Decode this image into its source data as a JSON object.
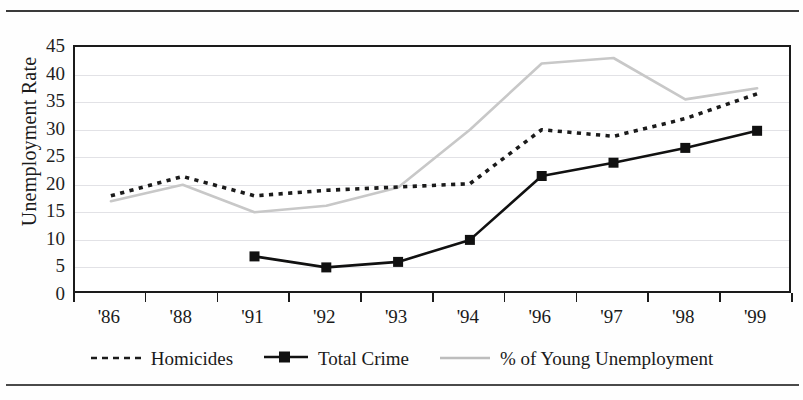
{
  "chart_data": {
    "type": "line",
    "title": "",
    "subtitle": "",
    "xlabel": "",
    "ylabel": "Unemployment Rate",
    "categories": [
      "'86",
      "'88",
      "'91",
      "'92",
      "'93",
      "'94",
      "'96",
      "'97",
      "'98",
      "'99"
    ],
    "ylim": [
      0,
      45
    ],
    "yticks": [
      0,
      5,
      10,
      15,
      20,
      25,
      30,
      35,
      40,
      45
    ],
    "grid": true,
    "legend_position": "bottom",
    "series": [
      {
        "name": "Homicides",
        "style": "dashed",
        "color": "#1b1b1b",
        "marker": "none",
        "values": [
          18.0,
          21.5,
          18.0,
          19.0,
          19.6,
          20.2,
          30.0,
          28.8,
          32.0,
          36.5
        ]
      },
      {
        "name": "Total Crime",
        "style": "solid",
        "color": "#111111",
        "marker": "square",
        "values": [
          null,
          null,
          7.0,
          5.0,
          6.0,
          10.0,
          21.6,
          24.0,
          26.7,
          29.8
        ]
      },
      {
        "name": "% of Young Unemployment",
        "style": "solid",
        "color": "#c8c8c8",
        "marker": "none",
        "values": [
          17.0,
          20.0,
          15.0,
          16.2,
          19.5,
          30.0,
          42.0,
          43.0,
          35.5,
          37.5
        ]
      }
    ]
  },
  "axis": {
    "y_label": "Unemployment Rate",
    "y_tick_labels": [
      "45",
      "40",
      "35",
      "30",
      "25",
      "20",
      "15",
      "10",
      "5",
      "0"
    ],
    "x_tick_labels": [
      "'86",
      "'88",
      "'91",
      "'92",
      "'93",
      "'94",
      "'96",
      "'97",
      "'98",
      "'99"
    ]
  },
  "legend": {
    "items": [
      {
        "label": "Homicides",
        "swatch": "dashed-line-swatch",
        "color": "#1b1b1b"
      },
      {
        "label": "Total Crime",
        "swatch": "solid-line-square-marker-swatch",
        "color": "#111111"
      },
      {
        "label": "% of Young Unemployment",
        "swatch": "solid-gray-line-swatch",
        "color": "#bdbdbd"
      }
    ]
  },
  "colors": {
    "axis": "#1b1b1b",
    "grid": "#e2e2e6",
    "homicides": "#1b1b1b",
    "total_crime": "#111111",
    "young_unemployment": "#c8c8c8",
    "page_background": "#fefefe"
  }
}
